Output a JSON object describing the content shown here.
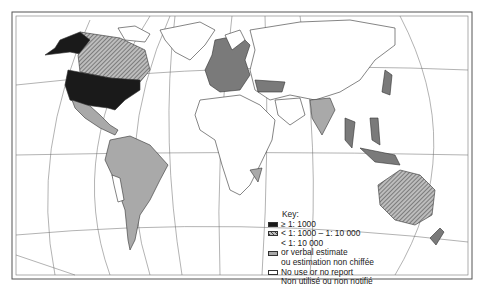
{
  "map": {
    "type": "world-choropleth",
    "projection": "pseudo-cylindrical",
    "colors": {
      "black": "#1a1a1a",
      "hatched": "#7a7a7a",
      "grey": "#a9a9a9",
      "white": "#ffffff",
      "outline": "#333333"
    }
  },
  "legend": {
    "title": "Key:",
    "items": [
      {
        "symbol": "black",
        "label": "≥ 1: 1000"
      },
      {
        "symbol": "hatched",
        "label": "< 1: 1000 – 1: 10 000"
      },
      {
        "symbol": "none",
        "label": "< 1: 10 000"
      },
      {
        "symbol": "grey",
        "label": "or verbal estimate"
      },
      {
        "symbol": "none",
        "label": "ou estimation non chiffée"
      },
      {
        "symbol": "white",
        "label": "No use or no report"
      },
      {
        "symbol": "none",
        "label": "Non utilisé ou non notifié"
      }
    ]
  }
}
